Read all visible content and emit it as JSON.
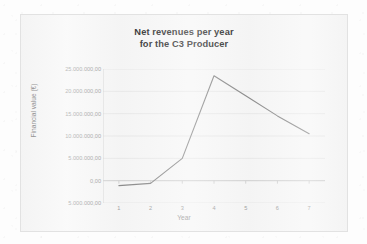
{
  "chart_data": {
    "type": "line",
    "title": "Net revenues per year",
    "title_line2": "for the C3 Producer",
    "xlabel": "Year",
    "ylabel": "Financial value (€)",
    "x": [
      1,
      2,
      3,
      4,
      5,
      6,
      7
    ],
    "xtick_labels": [
      "1",
      "2",
      "3",
      "4",
      "5",
      "6",
      "7"
    ],
    "values": [
      -1100000,
      -600000,
      5000000,
      23500000,
      19000000,
      14500000,
      10500000
    ],
    "ylim": [
      -5000000,
      25000000
    ],
    "ytick_labels": [
      "25.000.000,00",
      "20.000.000,00",
      "15.000.000,00",
      "10.000.000,00",
      "5.000.000,00",
      "0,00",
      "5.000.000,00"
    ],
    "ytick_values": [
      25000000,
      20000000,
      15000000,
      10000000,
      5000000,
      0,
      -5000000
    ],
    "grid": true,
    "legend": false,
    "series": [
      {
        "name": "Net revenues",
        "color": "#8c8c8c",
        "values": [
          -1100000,
          -600000,
          5000000,
          23500000,
          19000000,
          14500000,
          10500000
        ]
      }
    ],
    "colors": {
      "line": "#8c8c8c",
      "grid": "#e6e6e6",
      "axis": "#d0d0d0",
      "plot_background": "#f7f7f7",
      "title_text": "#333333",
      "tick_text": "#9b9b9b"
    }
  }
}
